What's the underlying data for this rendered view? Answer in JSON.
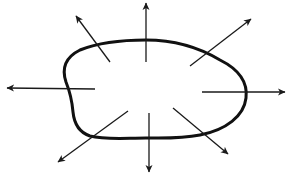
{
  "diagram": {
    "type": "radiating-arrows",
    "colors": {
      "background": "#ffffff",
      "stroke": "#111111"
    },
    "shape": {
      "name": "irregular-closed-blob",
      "path": "M 66 82 C 62 70, 64 58, 80 50 C 100 42, 125 40, 146 40 C 175 40, 200 48, 220 60 C 240 70, 248 82, 246 98 C 244 116, 226 130, 200 135 C 180 139, 160 138, 146 138 C 125 138, 105 140, 90 136 C 78 132, 74 122, 73 112 C 72 100, 70 92, 66 82 Z"
    },
    "arrows": [
      {
        "direction": "up-left",
        "x1": 110,
        "y1": 62,
        "x2": 76,
        "y2": 16
      },
      {
        "direction": "up",
        "x1": 146,
        "y1": 62,
        "x2": 146,
        "y2": 3
      },
      {
        "direction": "up-right",
        "x1": 190,
        "y1": 66,
        "x2": 251,
        "y2": 19
      },
      {
        "direction": "right",
        "x1": 202,
        "y1": 92,
        "x2": 285,
        "y2": 92
      },
      {
        "direction": "left",
        "x1": 95,
        "y1": 89,
        "x2": 7,
        "y2": 88
      },
      {
        "direction": "down-left",
        "x1": 128,
        "y1": 111,
        "x2": 58,
        "y2": 162
      },
      {
        "direction": "down",
        "x1": 149,
        "y1": 113,
        "x2": 149,
        "y2": 172
      },
      {
        "direction": "down-right",
        "x1": 173,
        "y1": 108,
        "x2": 228,
        "y2": 154
      }
    ]
  }
}
